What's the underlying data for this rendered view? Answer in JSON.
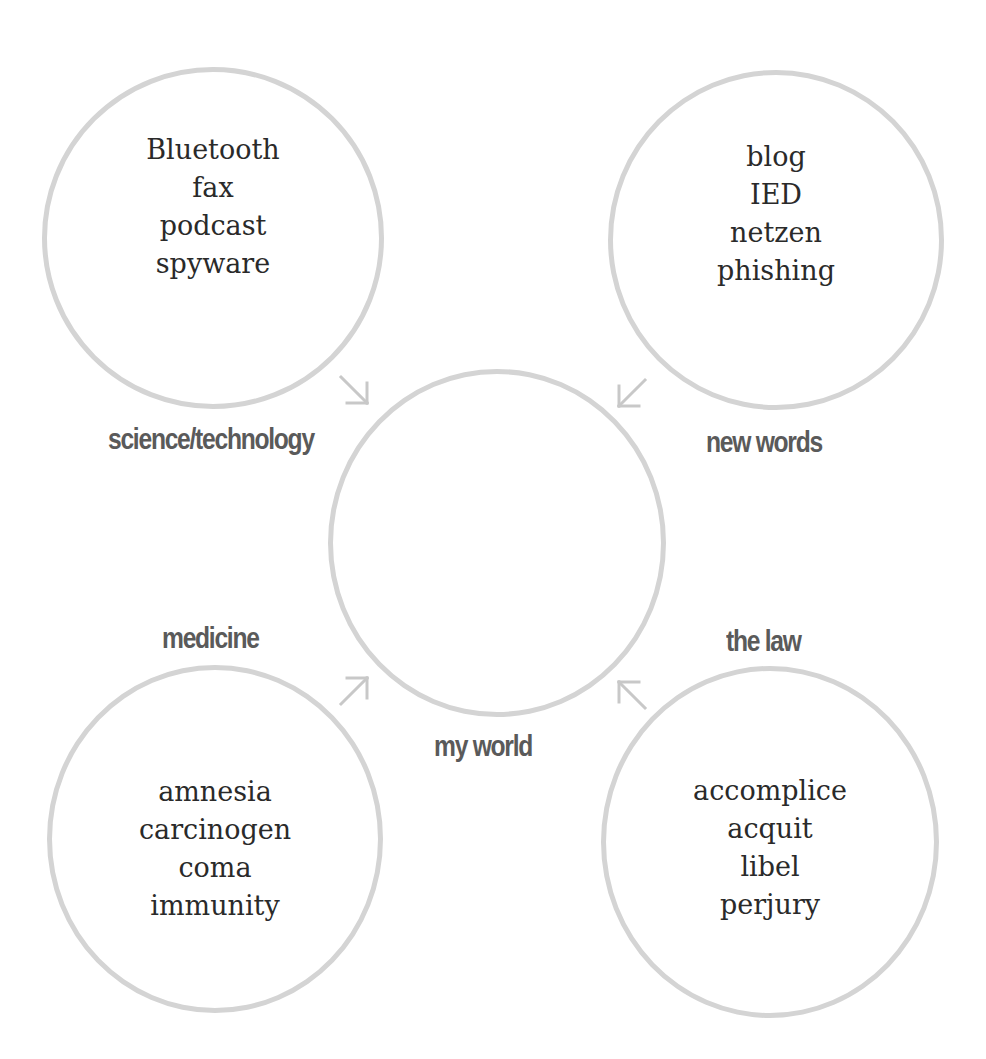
{
  "diagram": {
    "center": {
      "label": "my world"
    },
    "categories": [
      {
        "label": "science/technology",
        "words": [
          "Bluetooth",
          "fax",
          "podcast",
          "spyware"
        ]
      },
      {
        "label": "new words",
        "words": [
          "blog",
          "IED",
          "netzen",
          "phishing"
        ]
      },
      {
        "label": "medicine",
        "words": [
          "amnesia",
          "carcinogen",
          "coma",
          "immunity"
        ]
      },
      {
        "label": "the law",
        "words": [
          "accomplice",
          "acquit",
          "libel",
          "perjury"
        ]
      }
    ],
    "colors": {
      "circle_stroke": "#d4d4d4",
      "label_text": "#5a5a5a",
      "word_text": "#2a2a2a",
      "arrow": "#c8c8c8"
    },
    "arrows": [
      {
        "from": "science/technology",
        "to": "my world",
        "direction": "down-right"
      },
      {
        "from": "new words",
        "to": "my world",
        "direction": "down-left"
      },
      {
        "from": "medicine",
        "to": "my world",
        "direction": "up-right"
      },
      {
        "from": "the law",
        "to": "my world",
        "direction": "up-left"
      }
    ]
  }
}
